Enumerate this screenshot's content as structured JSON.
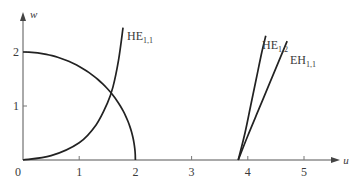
{
  "chart_data": {
    "type": "line",
    "title": "",
    "xlabel": "u",
    "ylabel": "w",
    "xlim": [
      0,
      5.5
    ],
    "ylim": [
      0,
      2.5
    ],
    "grid": false,
    "legend": "inline labels near curves",
    "x_ticks": [
      "0",
      "1",
      "2",
      "3",
      "4",
      "5"
    ],
    "y_ticks": [
      "1",
      "2"
    ],
    "series": [
      {
        "name": "circle",
        "label": "",
        "description": "w = sqrt(4 - u^2), quarter circle of radius 2",
        "points": [
          [
            0,
            2.0
          ],
          [
            0.5,
            1.94
          ],
          [
            1.0,
            1.73
          ],
          [
            1.3,
            1.52
          ],
          [
            1.6,
            1.2
          ],
          [
            1.8,
            0.87
          ],
          [
            1.9,
            0.62
          ],
          [
            1.97,
            0.35
          ],
          [
            2.0,
            0.0
          ]
        ]
      },
      {
        "name": "HE_1,1",
        "label": "HE",
        "sub": "1,1",
        "points": [
          [
            0,
            0.0
          ],
          [
            0.5,
            0.08
          ],
          [
            1.0,
            0.32
          ],
          [
            1.3,
            0.65
          ],
          [
            1.5,
            1.05
          ],
          [
            1.6,
            1.35
          ],
          [
            1.7,
            1.85
          ],
          [
            1.78,
            2.45
          ]
        ]
      },
      {
        "name": "HE_1,2",
        "label": "HE",
        "sub": "1,2",
        "points": [
          [
            3.83,
            0.0
          ],
          [
            3.95,
            0.5
          ],
          [
            4.05,
            1.0
          ],
          [
            4.15,
            1.5
          ],
          [
            4.25,
            2.0
          ],
          [
            4.32,
            2.3
          ]
        ]
      },
      {
        "name": "EH_1,1",
        "label": "EH",
        "sub": "1,1",
        "points": [
          [
            3.83,
            0.0
          ],
          [
            4.0,
            0.45
          ],
          [
            4.2,
            0.95
          ],
          [
            4.4,
            1.45
          ],
          [
            4.58,
            1.9
          ],
          [
            4.7,
            2.2
          ]
        ]
      }
    ]
  }
}
